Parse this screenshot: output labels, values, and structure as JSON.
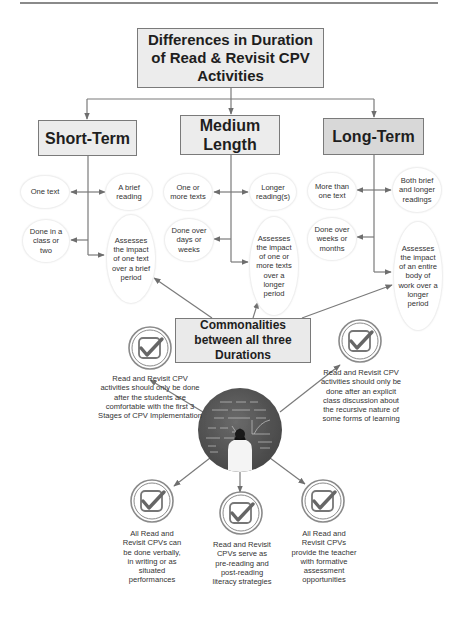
{
  "title": "Differences in Duration of Read & Revisit CPV Activities",
  "categories": [
    {
      "label": "Short-Term",
      "row1": {
        "left": "One text",
        "right": "A brief reading"
      },
      "row2": {
        "left": "Done in a class or two",
        "right": "Assesses the impact of one text over a brief period"
      }
    },
    {
      "label": "Medium Length",
      "row1": {
        "left": "One or more texts",
        "right": "Longer reading(s)"
      },
      "row2": {
        "left": "Done over days or weeks",
        "right": "Assesses the impact of one or more texts over a longer period"
      }
    },
    {
      "label": "Long-Term",
      "row1": {
        "left": "More than one text",
        "right": "Both brief and longer readings"
      },
      "row2": {
        "left": "Done over weeks or months",
        "right": "Assesses the impact of an entire body of work over a longer period"
      }
    }
  ],
  "commonalities": {
    "title": "Commonalities between all three Durations",
    "image_description": "student facing chalkboard with math equations",
    "items": [
      {
        "position": "upper-left",
        "icon": "checkmark-icon",
        "text": "Read and Revisit CPV activities should only be done after the students are comfortable with the first 3 Stages of CPV Implementation"
      },
      {
        "position": "upper-right",
        "icon": "checkmark-icon",
        "text": "Read and Revisit CPV activities should only be done after an explicit class discussion about the recursive nature of some forms of learning"
      },
      {
        "position": "lower-left",
        "icon": "checkmark-icon",
        "text": "All Read and Revisit CPVs can be done verbally, in writing or as situated performances"
      },
      {
        "position": "lower-center",
        "icon": "checkmark-icon",
        "text": "Read and Revisit CPVs serve as pre-reading and post-reading literacy strategies"
      },
      {
        "position": "lower-right",
        "icon": "checkmark-icon",
        "text": "All Read and Revisit CPVs provide the teacher with formative assessment opportunities"
      }
    ]
  },
  "colors": {
    "box_fill": "#ececec",
    "long_term_fill": "#d8d8d8",
    "line": "#6e6e6e",
    "text": "#2b2b2b"
  }
}
